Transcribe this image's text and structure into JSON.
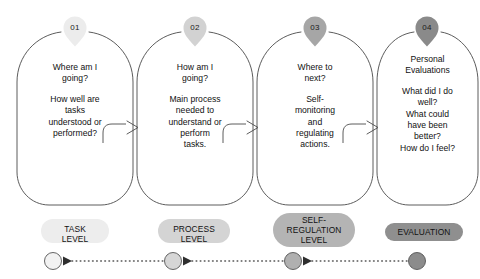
{
  "diagram": {
    "colors": {
      "outline": "#4a4a4a",
      "badge_01": "#ececec",
      "badge_02": "#d2d2d2",
      "badge_03": "#a6a6a6",
      "badge_04": "#8a8a8a",
      "pill_01": "#ededed",
      "pill_02": "#d4d4d4",
      "pill_03": "#b4b4b4",
      "pill_04": "#8f8f8f",
      "dot_01": "#f2f2f2",
      "dot_02": "#d6d6d6",
      "dot_03": "#b0b0b0",
      "dot_04": "#8c8c8c",
      "timeline": "#555555",
      "text": "#111111"
    },
    "steps": [
      {
        "number": "01",
        "paragraphs": [
          [
            "Where am I",
            "going?"
          ],
          [
            "How well are",
            "tasks",
            "understood or",
            "performed?"
          ]
        ],
        "level_label": [
          "TASK",
          "LEVEL"
        ]
      },
      {
        "number": "02",
        "paragraphs": [
          [
            "How am I",
            "going?"
          ],
          [
            "Main process",
            "needed to",
            "understand or",
            "perform",
            "tasks."
          ]
        ],
        "level_label": [
          "PROCESS",
          "LEVEL"
        ]
      },
      {
        "number": "03",
        "paragraphs": [
          [
            "Where to",
            "next?"
          ],
          [
            "Self-",
            "monitoring",
            "and",
            "regulating",
            "actions."
          ]
        ],
        "level_label": [
          "SELF-",
          "REGULATION",
          "LEVEL"
        ]
      },
      {
        "number": "04",
        "paragraphs": [
          [
            "Personal",
            "Evaluations"
          ],
          [
            "What did I do",
            "well?",
            "What could",
            "have been",
            "better?",
            "How do I feel?"
          ]
        ],
        "level_label": [
          "EVALUATION"
        ]
      }
    ]
  }
}
